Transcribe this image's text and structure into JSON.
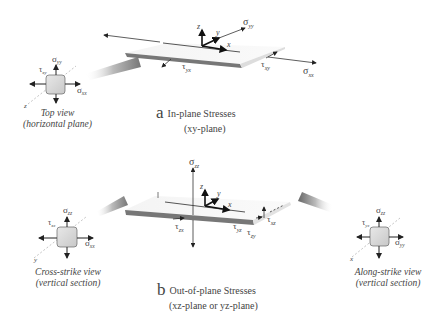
{
  "panel_a": {
    "letter": "a",
    "title": "In-plane Stresses",
    "subtitle": "(xy-plane)",
    "axes": {
      "x": "x",
      "y": "y",
      "z": "z"
    },
    "labels": {
      "sigma_yy": "σ",
      "sigma_yy_sub": "yy",
      "sigma_xx": "σ",
      "sigma_xx_sub": "xx",
      "tau_yx": "τ",
      "tau_yx_sub": "yx",
      "tau_xy": "τ",
      "tau_xy_sub": "xy"
    },
    "inset": {
      "line1": "Top view",
      "line2": "(horizontal plane)",
      "sigma_top": "σ",
      "sigma_top_sub": "yy",
      "sigma_right": "σ",
      "sigma_right_sub": "xx",
      "tau": "τ",
      "tau_sub": "xy",
      "axis": "z"
    }
  },
  "panel_b": {
    "letter": "b",
    "title": "Out-of-plane Stresses",
    "subtitle": "(xz-plane or yz-plane)",
    "axes": {
      "x": "x",
      "y": "y",
      "z": "z"
    },
    "labels": {
      "sigma_zz": "σ",
      "sigma_zz_sub": "zz",
      "tau_zx": "τ",
      "tau_zx_sub": "zx",
      "tau_yz": "τ",
      "tau_yz_sub": "yz",
      "tau_zy": "τ",
      "tau_zy_sub": "zy",
      "tau_xz": "τ",
      "tau_xz_sub": "xz"
    },
    "inset_left": {
      "line1": "Cross-strike view",
      "line2": "(vertical section)",
      "sigma_top": "σ",
      "sigma_top_sub": "zz",
      "sigma_right": "σ",
      "sigma_right_sub": "xx",
      "tau": "τ",
      "tau_sub": "xz",
      "axis": "y"
    },
    "inset_right": {
      "line1": "Along-strike view",
      "line2": "(vertical section)",
      "sigma_top": "σ",
      "sigma_top_sub": "zz",
      "sigma_right": "σ",
      "sigma_right_sub": "yy",
      "tau": "τ",
      "tau_sub": "yz",
      "axis": "x"
    }
  }
}
